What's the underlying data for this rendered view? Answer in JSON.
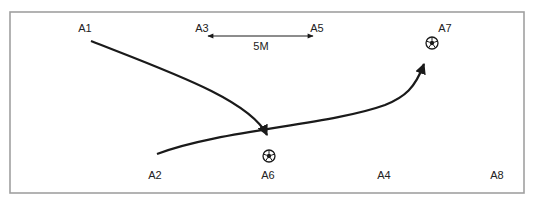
{
  "diagram": {
    "frame": {
      "x": 10,
      "y": 12,
      "width": 514,
      "height": 181,
      "border_color": "#a0a0a0"
    },
    "positions": [
      {
        "id": "A1",
        "label": "A1",
        "x": 85,
        "y": 31
      },
      {
        "id": "A2",
        "label": "A2",
        "x": 155,
        "y": 178
      },
      {
        "id": "A3",
        "label": "A3",
        "x": 202,
        "y": 31
      },
      {
        "id": "A4",
        "label": "A4",
        "x": 384,
        "y": 178
      },
      {
        "id": "A5",
        "label": "A5",
        "x": 317,
        "y": 31
      },
      {
        "id": "A6",
        "label": "A6",
        "x": 268,
        "y": 178
      },
      {
        "id": "A7",
        "label": "A7",
        "x": 445,
        "y": 31
      },
      {
        "id": "A8",
        "label": "A8",
        "x": 497,
        "y": 178
      }
    ],
    "scale_bar": {
      "label": "5M",
      "from": "A3",
      "to": "A5",
      "x1": 208,
      "x2": 313,
      "y": 36,
      "label_x": 261,
      "label_y": 50
    },
    "balls": [
      {
        "id": "ball-a6",
        "near": "A6",
        "cx": 269,
        "cy": 156
      },
      {
        "id": "ball-a7",
        "near": "A7",
        "cx": 432,
        "cy": 43
      }
    ],
    "paths": [
      {
        "id": "run-a1-to-a6",
        "description": "Curved run from A1 toward the ball at A6",
        "d": "M 91 41 C 170 72, 250 100, 267 135"
      },
      {
        "id": "pass-a2-to-a7",
        "description": "Curved pass from A2 to the ball at A7",
        "d": "M 157 154 C 220 130, 330 125, 385 105 C 405 97, 415 88, 424 64"
      }
    ],
    "colors": {
      "line": "#1a1a1a",
      "text": "#222222",
      "frame": "#a0a0a0"
    }
  }
}
